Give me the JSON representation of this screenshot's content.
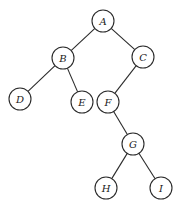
{
  "diagram": {
    "type": "binary-tree",
    "node_radius": 11,
    "colors": {
      "stroke": "#2a2a2a",
      "fill": "#ffffff",
      "text": "#1a1a1a"
    },
    "nodes": [
      {
        "id": "A",
        "label": "A",
        "x": 103,
        "y": 21
      },
      {
        "id": "B",
        "label": "B",
        "x": 63,
        "y": 58
      },
      {
        "id": "C",
        "label": "C",
        "x": 143,
        "y": 57
      },
      {
        "id": "D",
        "label": "D",
        "x": 20,
        "y": 99
      },
      {
        "id": "E",
        "label": "E",
        "x": 82,
        "y": 102
      },
      {
        "id": "F",
        "label": "F",
        "x": 108,
        "y": 102
      },
      {
        "id": "G",
        "label": "G",
        "x": 133,
        "y": 144
      },
      {
        "id": "H",
        "label": "H",
        "x": 106,
        "y": 188
      },
      {
        "id": "I",
        "label": "I",
        "x": 161,
        "y": 188
      }
    ],
    "edges": [
      {
        "from": "A",
        "to": "B"
      },
      {
        "from": "A",
        "to": "C"
      },
      {
        "from": "B",
        "to": "D"
      },
      {
        "from": "B",
        "to": "E"
      },
      {
        "from": "C",
        "to": "F"
      },
      {
        "from": "F",
        "to": "G"
      },
      {
        "from": "G",
        "to": "H"
      },
      {
        "from": "G",
        "to": "I"
      }
    ]
  }
}
